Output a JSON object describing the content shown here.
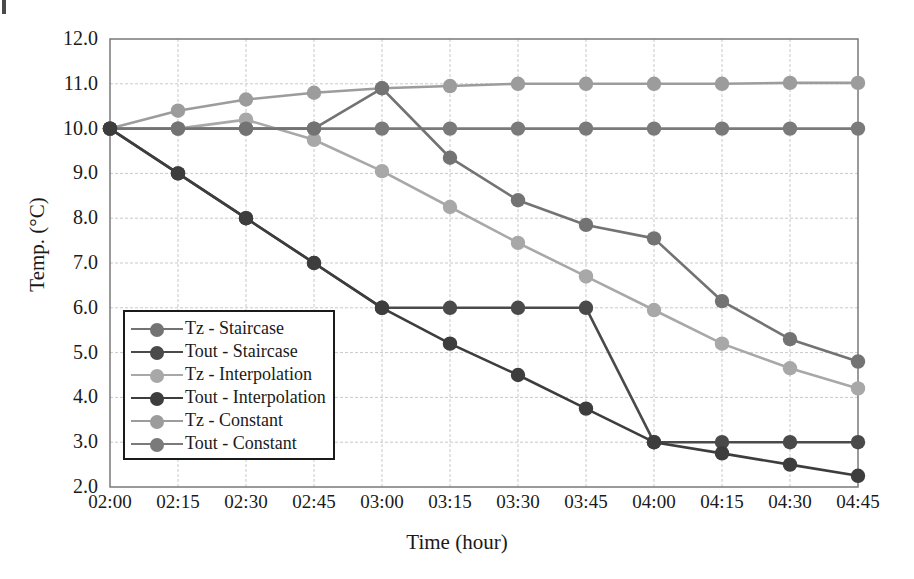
{
  "chart_data": {
    "type": "line",
    "title": "",
    "xlabel": "Time (hour)",
    "ylabel": "Temp. (°C)",
    "x": [
      "02:00",
      "02:15",
      "02:30",
      "02:45",
      "03:00",
      "03:15",
      "03:30",
      "03:45",
      "04:00",
      "04:15",
      "04:30",
      "04:45"
    ],
    "xlim": [
      0,
      11
    ],
    "ylim": [
      2.0,
      12.0
    ],
    "yticks": [
      "12.0",
      "11.0",
      "10.0",
      "9.0",
      "8.0",
      "7.0",
      "6.0",
      "5.0",
      "4.0",
      "3.0",
      "2.0"
    ],
    "ytick_values": [
      12.0,
      11.0,
      10.0,
      9.0,
      8.0,
      7.0,
      6.0,
      5.0,
      4.0,
      3.0,
      2.0
    ],
    "grid": true,
    "legend_position": "lower-left-inside",
    "series": [
      {
        "name": "Tz - Staircase",
        "color": "#737373",
        "values": [
          10.0,
          10.0,
          10.0,
          10.0,
          10.9,
          9.35,
          8.4,
          7.85,
          7.55,
          6.15,
          5.3,
          4.8
        ]
      },
      {
        "name": "Tout - Staircase",
        "color": "#4a4a4a",
        "values": [
          10.0,
          9.0,
          8.0,
          7.0,
          6.0,
          6.0,
          6.0,
          6.0,
          3.0,
          3.0,
          3.0,
          3.0
        ]
      },
      {
        "name": "Tz - Interpolation",
        "color": "#a8a8a8",
        "values": [
          10.0,
          10.0,
          10.2,
          9.75,
          9.05,
          8.25,
          7.45,
          6.7,
          5.95,
          5.2,
          4.65,
          4.2
        ]
      },
      {
        "name": "Tout - Interpolation",
        "color": "#3d3d3d",
        "values": [
          10.0,
          9.0,
          8.0,
          7.0,
          6.0,
          5.2,
          4.5,
          3.75,
          3.0,
          2.75,
          2.5,
          2.25
        ]
      },
      {
        "name": "Tz - Constant",
        "color": "#9c9c9c",
        "values": [
          10.0,
          10.4,
          10.65,
          10.8,
          10.9,
          10.95,
          11.0,
          11.0,
          11.0,
          11.0,
          11.02,
          11.02
        ]
      },
      {
        "name": "Tout - Constant",
        "color": "#7a7a7a",
        "values": [
          10.0,
          10.0,
          10.0,
          10.0,
          10.0,
          10.0,
          10.0,
          10.0,
          10.0,
          10.0,
          10.0,
          10.0
        ]
      }
    ]
  },
  "axes": {
    "y_title": "Temp. (°C)",
    "x_title": "Time (hour)"
  }
}
